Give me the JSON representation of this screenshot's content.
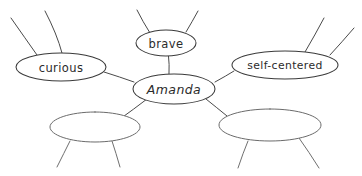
{
  "diagram": {
    "type": "character-web",
    "style": "hand-drawn",
    "background_color": "#ffffff",
    "stroke_color": "#4a4a4a",
    "text_color": "#2b2b2b",
    "center": {
      "id": "amanda",
      "label": "Amanda",
      "cx": 174,
      "cy": 89,
      "rx": 41,
      "ry": 15
    },
    "nodes": [
      {
        "id": "curious",
        "label": "curious",
        "cx": 61,
        "cy": 67,
        "rx": 45,
        "ry": 14,
        "empty": false,
        "spokes": 2
      },
      {
        "id": "brave",
        "label": "brave",
        "cx": 166,
        "cy": 43,
        "rx": 30,
        "ry": 13,
        "empty": false,
        "spokes": 2
      },
      {
        "id": "self-centered",
        "label": "self-centered",
        "cx": 285,
        "cy": 65,
        "rx": 53,
        "ry": 14,
        "empty": false,
        "spokes": 2
      },
      {
        "id": "blank-left",
        "label": "",
        "cx": 95,
        "cy": 127,
        "rx": 45,
        "ry": 15,
        "empty": true,
        "spokes": 2
      },
      {
        "id": "blank-right",
        "label": "",
        "cx": 270,
        "cy": 125,
        "rx": 51,
        "ry": 16,
        "empty": true,
        "spokes": 2
      }
    ],
    "connector_count": 5,
    "spoke_total": 10
  }
}
